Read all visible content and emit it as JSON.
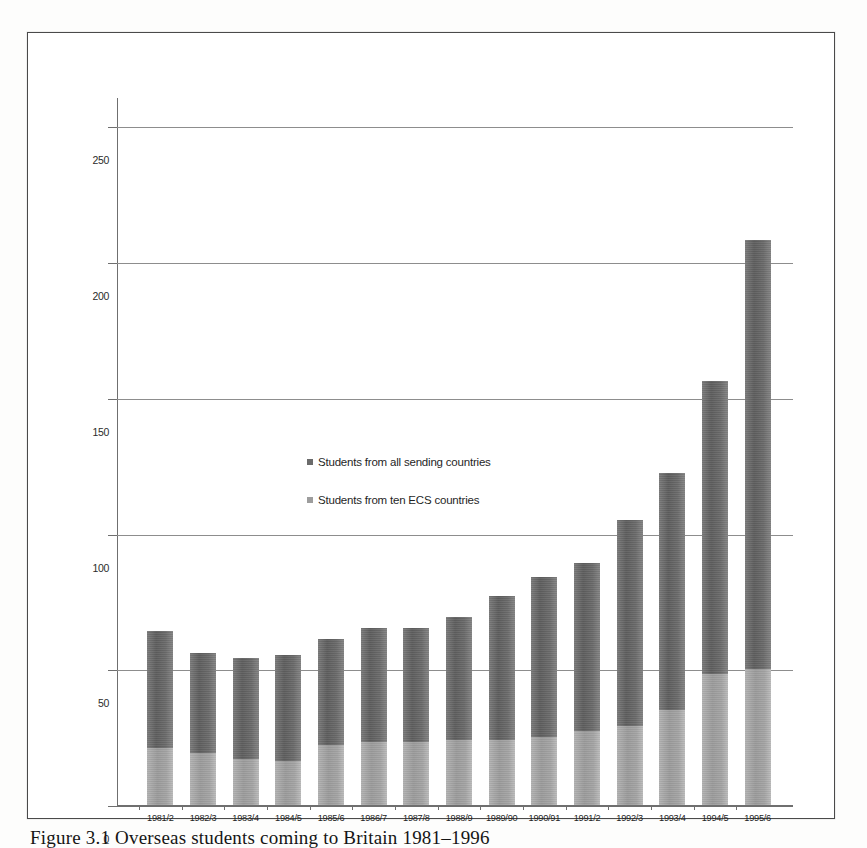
{
  "figure": {
    "caption": "Figure 3.1 Overseas students coming to Britain 1981–1996"
  },
  "legend": {
    "position": "inside-left",
    "items": [
      {
        "label": "Students from all sending countries",
        "marker": "square-marker",
        "color": "#6b6b6b"
      },
      {
        "label": "Students from ten ECS countries",
        "marker": "square-marker",
        "color": "#9d9d9d"
      }
    ]
  },
  "axes": {
    "y_ticks": [
      "250",
      "200",
      "150",
      "100",
      "50",
      "0"
    ],
    "x_ticks": [
      "1981/2",
      "1982/3",
      "1983/4",
      "1984/5",
      "1985/6",
      "1986/7",
      "1987/8",
      "1988/9",
      "1989/90",
      "1990/91",
      "1991/2",
      "1992/3",
      "1993/4",
      "1994/5",
      "1995/6"
    ]
  },
  "chart_data": {
    "type": "bar",
    "title": "Overseas students coming to Britain 1981–1996",
    "xlabel": "",
    "ylabel": "",
    "ylim": [
      0,
      250
    ],
    "grid": true,
    "legend_position": "inside-left",
    "stacked": true,
    "categories": [
      "1981/2",
      "1982/3",
      "1983/4",
      "1984/5",
      "1985/6",
      "1986/7",
      "1987/8",
      "1988/9",
      "1989/90",
      "1990/91",
      "1991/2",
      "1992/3",
      "1993/4",
      "1994/5",
      "1995/6"
    ],
    "series": [
      {
        "name": "Students from ten ECS countries",
        "color": "#9d9d9d",
        "values": [
          21,
          19,
          17,
          16,
          22,
          23,
          23,
          24,
          24,
          25,
          27,
          29,
          35,
          48,
          50
        ]
      },
      {
        "name": "Students from all sending countries",
        "color": "#6b6b6b",
        "values": [
          64,
          56,
          54,
          55,
          61,
          65,
          65,
          69,
          77,
          84,
          89,
          105,
          122,
          156,
          208
        ]
      }
    ],
    "totals": [
      64,
      56,
      54,
      55,
      61,
      65,
      65,
      69,
      77,
      84,
      89,
      105,
      122,
      156,
      208
    ]
  }
}
